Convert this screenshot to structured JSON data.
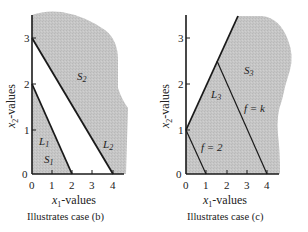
{
  "panels": [
    {
      "id": "b",
      "caption": "Illustrates case (b)",
      "xlabel_var": "x",
      "xlabel_sub": "1",
      "xlabel_suffix": "-values",
      "ylabel_var": "x",
      "ylabel_sub": "2",
      "ylabel_suffix": "-values",
      "x_ticks": [
        "0",
        "1",
        "2",
        "3",
        "4"
      ],
      "y_ticks": [
        "0",
        "1",
        "2",
        "3"
      ],
      "labels": {
        "S2_main": "S",
        "S2_sub": "2",
        "L1_main": "L",
        "L1_sub": "1",
        "S1_main": "S",
        "S1_sub": "1",
        "L2_main": "L",
        "L2_sub": "2"
      },
      "lines": [
        {
          "name": "L1",
          "x_intercept": 2,
          "y_intercept": 2
        },
        {
          "name": "L2",
          "x_intercept": 4,
          "y_intercept": 3
        }
      ]
    },
    {
      "id": "c",
      "caption": "Illustrates case (c)",
      "xlabel_var": "x",
      "xlabel_sub": "1",
      "xlabel_suffix": "-values",
      "ylabel_var": "x",
      "ylabel_sub": "2",
      "ylabel_suffix": "-values",
      "x_ticks": [
        "0",
        "1",
        "2",
        "3",
        "4"
      ],
      "y_ticks": [
        "0",
        "1",
        "2",
        "3"
      ],
      "labels": {
        "S3_main": "S",
        "S3_sub": "3",
        "L3_main": "L",
        "L3_sub": "3",
        "fk": "f = k",
        "f2": "f = 2"
      },
      "lines": [
        {
          "name": "L3",
          "from": [
            0,
            1
          ],
          "to": [
            2.5,
            3.5
          ]
        },
        {
          "name": "f=2",
          "from": [
            0,
            1
          ],
          "to": [
            1,
            0
          ]
        },
        {
          "name": "f=k",
          "from": [
            1.5,
            2.5
          ],
          "to": [
            4,
            0
          ]
        }
      ]
    }
  ],
  "colors": {
    "region_fill": "#c4c4c4",
    "line": "#1a1a1a"
  }
}
